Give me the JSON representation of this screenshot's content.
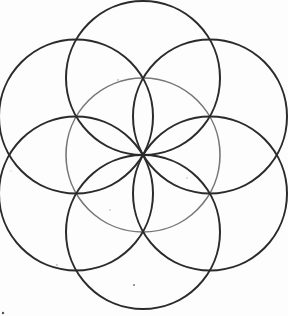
{
  "figure": {
    "title": "Seed of Life",
    "center": [
      143,
      155
    ],
    "radius": 77,
    "colors": {
      "background": "#fdfdfd",
      "outer_stroke": "#2b2b2b",
      "center_stroke": "#777777"
    },
    "circles": [
      {
        "name": "center",
        "cx": 143,
        "cy": 155,
        "stroke": "#777777"
      },
      {
        "name": "top",
        "cx": 143,
        "cy": 78,
        "stroke": "#2b2b2b"
      },
      {
        "name": "top-right",
        "cx": 210,
        "cy": 116.5,
        "stroke": "#2b2b2b"
      },
      {
        "name": "bottom-right",
        "cx": 210,
        "cy": 193.5,
        "stroke": "#2b2b2b"
      },
      {
        "name": "bottom",
        "cx": 143,
        "cy": 232,
        "stroke": "#2b2b2b"
      },
      {
        "name": "bottom-left",
        "cx": 76,
        "cy": 193.5,
        "stroke": "#2b2b2b"
      },
      {
        "name": "top-left",
        "cx": 76,
        "cy": 116.5,
        "stroke": "#2b2b2b"
      }
    ]
  }
}
